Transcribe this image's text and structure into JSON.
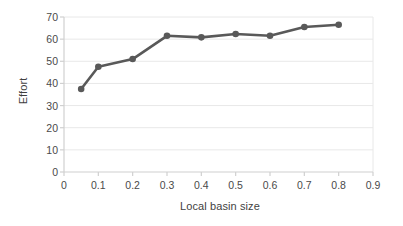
{
  "chart_data": {
    "type": "line",
    "title": "",
    "xlabel": "Local basin size",
    "ylabel": "Effort",
    "x": [
      0.05,
      0.1,
      0.2,
      0.3,
      0.4,
      0.5,
      0.6,
      0.7,
      0.8
    ],
    "values": [
      37.5,
      47.5,
      51.0,
      61.5,
      60.8,
      62.3,
      61.5,
      65.5,
      66.5
    ],
    "series": [
      {
        "name": "Effort",
        "x": [
          0.05,
          0.1,
          0.2,
          0.3,
          0.4,
          0.5,
          0.6,
          0.7,
          0.8
        ],
        "values": [
          37.5,
          47.5,
          51.0,
          61.5,
          60.8,
          62.3,
          61.5,
          65.5,
          66.5
        ],
        "color": "#595959",
        "marker": "circle"
      }
    ],
    "xlim": [
      0,
      0.9
    ],
    "ylim": [
      0,
      70
    ],
    "xticks": [
      0,
      0.1,
      0.2,
      0.3,
      0.4,
      0.5,
      0.6,
      0.7,
      0.8,
      0.9
    ],
    "xtick_labels": [
      "0",
      "0.1",
      "0.2",
      "0.3",
      "0.4",
      "0.5",
      "0.6",
      "0.7",
      "0.8",
      "0.9"
    ],
    "yticks": [
      0,
      10,
      20,
      30,
      40,
      50,
      60,
      70
    ],
    "ytick_labels": [
      "0",
      "10",
      "20",
      "30",
      "40",
      "50",
      "60",
      "70"
    ],
    "grid": {
      "horizontal": true,
      "vertical": false,
      "color": "#e8e8e8"
    },
    "legend": {
      "visible": false,
      "position": "none"
    },
    "axis_line_color": "#d0d0d0",
    "background": "#ffffff"
  }
}
